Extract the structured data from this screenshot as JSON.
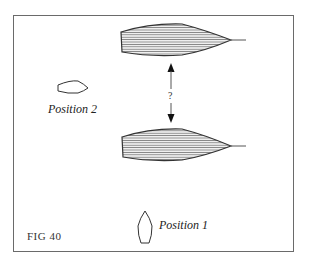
{
  "figure": {
    "caption": "FIG 40",
    "question_mark": "?",
    "labels": {
      "position_1": "Position 1",
      "position_2": "Position 2"
    },
    "colors": {
      "border": "#6a6a6a",
      "hull_stroke": "#333333",
      "hatch": "#777777",
      "background": "#ffffff"
    },
    "elements": [
      {
        "name": "large-hull-top",
        "type": "hatched-hull",
        "orientation": "bow-right"
      },
      {
        "name": "large-hull-bottom",
        "type": "hatched-hull",
        "orientation": "bow-right"
      },
      {
        "name": "double-arrow",
        "type": "vertical-double-arrow",
        "label": "?"
      },
      {
        "name": "small-boat-position-2",
        "type": "outline-boat",
        "orientation": "bow-right"
      },
      {
        "name": "small-boat-position-1",
        "type": "outline-boat",
        "orientation": "bow-up"
      }
    ]
  }
}
